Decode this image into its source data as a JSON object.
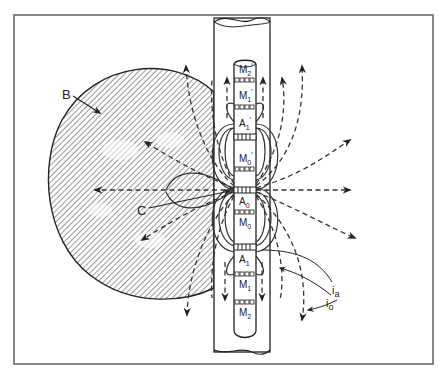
{
  "figure": {
    "type": "schematic",
    "frame": {
      "left": 14,
      "top": 15,
      "right": 433,
      "bottom": 364
    },
    "labels": {
      "body": "B",
      "center_electrode_pointer": "C",
      "current_a": "i",
      "current_a_sub": "a",
      "current_o": "i",
      "current_o_sub": "o"
    },
    "electrodes": [
      {
        "id": "M2p",
        "main": "M",
        "sub": "2",
        "prime": "′"
      },
      {
        "id": "M1p",
        "main": "M",
        "sub": "1",
        "prime": "′"
      },
      {
        "id": "A1p",
        "main": "A",
        "sub": "1",
        "prime": "′"
      },
      {
        "id": "M0p",
        "main": "M",
        "sub": "0",
        "prime": "′"
      },
      {
        "id": "A0",
        "main": "A",
        "sub": "0",
        "prime": ""
      },
      {
        "id": "M0",
        "main": "M",
        "sub": "0",
        "prime": ""
      },
      {
        "id": "A1",
        "main": "A",
        "sub": "1",
        "prime": ""
      },
      {
        "id": "M1",
        "main": "M",
        "sub": "1",
        "prime": ""
      },
      {
        "id": "M2",
        "main": "M",
        "sub": "2",
        "prime": ""
      }
    ],
    "colors": {
      "ink": "#333333",
      "background": "#ffffff"
    }
  }
}
